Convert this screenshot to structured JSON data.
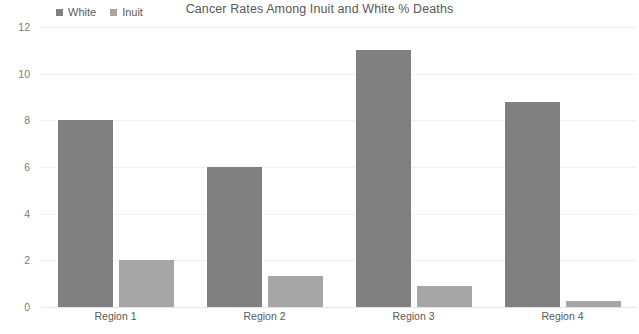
{
  "chart_data": {
    "type": "bar",
    "title": "Cancer Rates Among Inuit and White % Deaths",
    "xlabel": "",
    "ylabel": "",
    "categories": [
      "Region 1",
      "Region 2",
      "Region 3",
      "Region 4"
    ],
    "series": [
      {
        "name": "White",
        "color": "#808080",
        "values": [
          8,
          6,
          11,
          8.8
        ]
      },
      {
        "name": "Inuit",
        "color": "#a6a6a6",
        "values": [
          2,
          1.35,
          0.9,
          0.25
        ]
      }
    ],
    "ylim": [
      0,
      12
    ],
    "yticks": [
      0,
      2,
      4,
      6,
      8,
      10,
      12
    ],
    "ytick_labels": [
      "0",
      "2",
      "4",
      "6",
      "8",
      "10",
      "12"
    ],
    "grid": true,
    "legend_position": "top-left"
  }
}
